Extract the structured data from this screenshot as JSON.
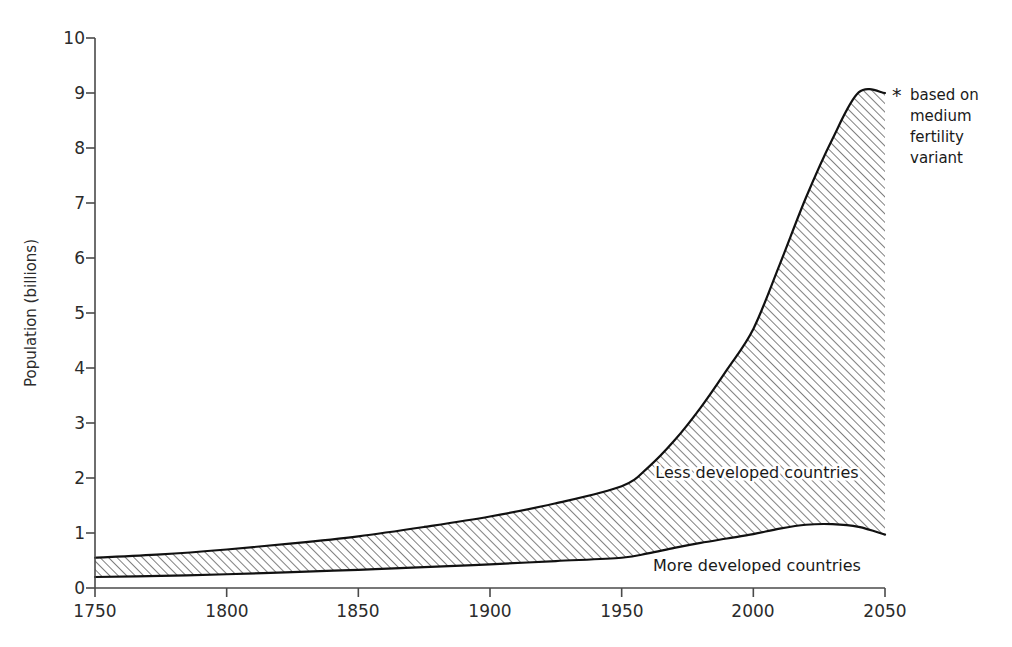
{
  "chart_data": {
    "type": "area",
    "title": "",
    "subtitle": "",
    "xlabel": "",
    "ylabel": "Population (billions)",
    "xlim": [
      1750,
      2050
    ],
    "ylim": [
      0,
      10
    ],
    "grid": false,
    "legend_position": "inline-annotation",
    "x_ticks": [
      "1750",
      "1800",
      "1850",
      "1900",
      "1950",
      "2000",
      "2050"
    ],
    "y_ticks": [
      "0",
      "1",
      "2",
      "3",
      "4",
      "5",
      "6",
      "7",
      "8",
      "9",
      "10"
    ],
    "x": [
      1750,
      1775,
      1800,
      1825,
      1850,
      1875,
      1900,
      1925,
      1950,
      1960,
      1970,
      1980,
      1990,
      2000,
      2010,
      2020,
      2030,
      2040,
      2050
    ],
    "series": [
      {
        "name": "More developed countries",
        "stacked_order": 1,
        "fill": "none",
        "values": [
          0.2,
          0.22,
          0.25,
          0.29,
          0.33,
          0.38,
          0.43,
          0.49,
          0.55,
          0.63,
          0.73,
          0.82,
          0.9,
          0.98,
          1.08,
          1.15,
          1.16,
          1.11,
          0.97
        ]
      },
      {
        "name": "Less developed countries",
        "stacked_order": 2,
        "fill": "diagonal-hatch",
        "values": [
          0.35,
          0.39,
          0.45,
          0.52,
          0.61,
          0.73,
          0.87,
          1.05,
          1.3,
          1.56,
          1.95,
          2.46,
          3.07,
          3.73,
          4.8,
          5.95,
          7.0,
          7.9,
          8.03
        ]
      }
    ],
    "total_curve": {
      "name": "Total world population",
      "values": [
        0.55,
        0.61,
        0.7,
        0.81,
        0.94,
        1.11,
        1.3,
        1.54,
        1.85,
        2.19,
        2.68,
        3.28,
        3.97,
        4.71,
        5.88,
        7.1,
        8.16,
        9.01,
        9.0
      ]
    },
    "annotations": [
      {
        "name": "footnote",
        "marker": "*",
        "lines": [
          "based on",
          "medium",
          "fertility",
          "variant"
        ]
      }
    ],
    "inline_labels": [
      {
        "name": "Less developed countries",
        "x": 1975,
        "y": 2.35
      },
      {
        "name": "More developed countries",
        "x": 1975,
        "y": 0.42
      }
    ],
    "colors": {
      "background": "#ffffff",
      "curve": "#111111",
      "hatch": "#555555",
      "axis": "#4a4a4a",
      "text": "#1a1a1a"
    }
  },
  "axis": {
    "y_title": "Population (billions)"
  },
  "labels": {
    "less_developed": "Less developed countries",
    "more_developed": "More developed countries"
  },
  "footnote": {
    "star": "*",
    "line1": "based on",
    "line2": "medium",
    "line3": "fertility",
    "line4": "variant"
  },
  "y_ticks": {
    "t0": "0",
    "t1": "1",
    "t2": "2",
    "t3": "3",
    "t4": "4",
    "t5": "5",
    "t6": "6",
    "t7": "7",
    "t8": "8",
    "t9": "9",
    "t10": "10"
  },
  "x_ticks": {
    "t0": "1750",
    "t1": "1800",
    "t2": "1850",
    "t3": "1900",
    "t4": "1950",
    "t5": "2000",
    "t6": "2050"
  }
}
